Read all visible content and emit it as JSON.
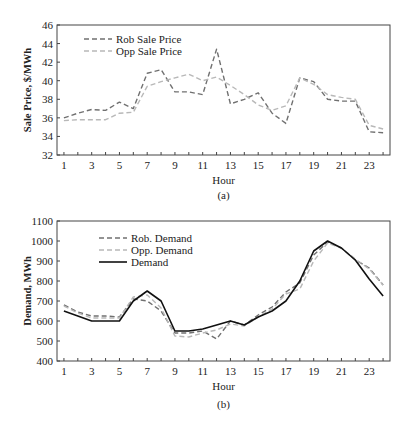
{
  "chart_data": [
    {
      "type": "line",
      "title": "",
      "caption": "(a)",
      "xlabel": "Hour",
      "ylabel": "Sale Price, $/MWh",
      "ylim": [
        32,
        46
      ],
      "yticks": [
        32,
        34,
        36,
        38,
        40,
        42,
        44,
        46
      ],
      "xticks": [
        1,
        3,
        5,
        7,
        9,
        11,
        13,
        15,
        17,
        19,
        21,
        23
      ],
      "x": [
        1,
        2,
        3,
        4,
        5,
        6,
        7,
        8,
        9,
        10,
        11,
        12,
        13,
        14,
        15,
        16,
        17,
        18,
        19,
        20,
        21,
        22,
        23,
        24
      ],
      "grid": false,
      "legend_position": "upper-left",
      "series": [
        {
          "name": "Rob Sale Price",
          "color": "#707070",
          "dash": "dashed",
          "values": [
            36.0,
            36.5,
            36.9,
            36.8,
            37.7,
            37.0,
            40.8,
            41.2,
            38.8,
            38.8,
            38.5,
            43.4,
            37.5,
            38.0,
            38.7,
            36.5,
            35.4,
            40.3,
            39.9,
            38.0,
            37.8,
            37.8,
            34.5,
            34.4
          ]
        },
        {
          "name": "Opp Sale Price",
          "color": "#b8b8b8",
          "dash": "dashed",
          "values": [
            35.7,
            35.8,
            35.8,
            35.8,
            36.5,
            36.6,
            39.4,
            39.9,
            40.3,
            40.7,
            40.0,
            40.4,
            39.5,
            38.5,
            37.4,
            36.8,
            37.3,
            40.3,
            39.6,
            38.5,
            38.2,
            38.0,
            35.2,
            34.8
          ]
        }
      ]
    },
    {
      "type": "line",
      "title": "",
      "caption": "(b)",
      "xlabel": "Hour",
      "ylabel": "Demand, MWh",
      "ylim": [
        400,
        1100
      ],
      "yticks": [
        400,
        500,
        600,
        700,
        800,
        900,
        1000,
        1100
      ],
      "xticks": [
        1,
        3,
        5,
        7,
        9,
        11,
        13,
        15,
        17,
        19,
        21,
        23
      ],
      "x": [
        1,
        2,
        3,
        4,
        5,
        6,
        7,
        8,
        9,
        10,
        11,
        12,
        13,
        14,
        15,
        16,
        17,
        18,
        19,
        20,
        21,
        22,
        23,
        24
      ],
      "grid": false,
      "legend_position": "upper-left",
      "series": [
        {
          "name": "Rob. Demand",
          "color": "#707070",
          "dash": "dashed",
          "values": [
            680,
            645,
            625,
            625,
            620,
            710,
            700,
            650,
            540,
            540,
            550,
            510,
            600,
            580,
            630,
            670,
            745,
            790,
            930,
            995,
            965,
            905,
            865,
            780
          ]
        },
        {
          "name": "Opp. Demand",
          "color": "#b8b8b8",
          "dash": "dashed",
          "values": [
            675,
            640,
            615,
            615,
            615,
            720,
            730,
            665,
            525,
            520,
            540,
            555,
            585,
            575,
            620,
            660,
            735,
            760,
            900,
            990,
            965,
            910,
            860,
            780
          ]
        },
        {
          "name": "Demand",
          "color": "#111111",
          "dash": "solid",
          "values": [
            650,
            625,
            600,
            600,
            600,
            700,
            750,
            700,
            550,
            550,
            560,
            580,
            600,
            580,
            620,
            650,
            700,
            800,
            950,
            1000,
            965,
            905,
            810,
            725
          ]
        }
      ]
    }
  ]
}
